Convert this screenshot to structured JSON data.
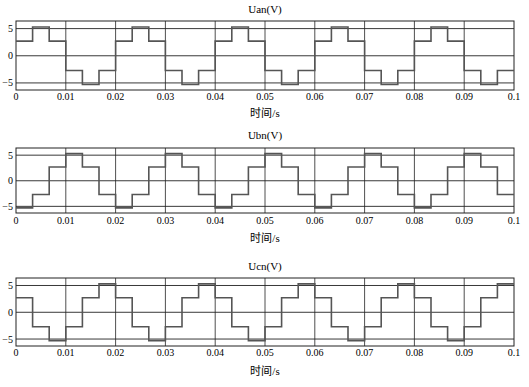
{
  "chart_data": [
    {
      "type": "line",
      "title": "Uan(V)",
      "xlabel": "时间/s",
      "ylabel": "",
      "xlim": [
        0,
        0.1
      ],
      "ylim": [
        -6.3,
        6.4
      ],
      "xticks": [
        "0",
        "0.01",
        "0.02",
        "0.03",
        "0.04",
        "0.05",
        "0.06",
        "0.07",
        "0.08",
        "0.09",
        "0.1"
      ],
      "yticks": [
        "5",
        "0",
        "-5"
      ],
      "grid": true,
      "step_period_s": 0.02,
      "pattern": [
        2.7,
        5.3,
        2.7,
        -2.7,
        -5.3,
        -2.7
      ]
    },
    {
      "type": "line",
      "title": "Ubn(V)",
      "xlabel": "时间/s",
      "ylabel": "",
      "xlim": [
        0,
        0.1
      ],
      "ylim": [
        -6.3,
        6.4
      ],
      "xticks": [
        "0",
        "0.01",
        "0.02",
        "0.03",
        "0.04",
        "0.05",
        "0.06",
        "0.07",
        "0.08",
        "0.09",
        "0.1"
      ],
      "yticks": [
        "5",
        "0",
        "-5"
      ],
      "grid": true,
      "step_period_s": 0.02,
      "pattern": [
        -5.3,
        -2.7,
        2.7,
        5.3,
        2.7,
        -2.7
      ]
    },
    {
      "type": "line",
      "title": "Ucn(V)",
      "xlabel": "时间/s",
      "ylabel": "",
      "xlim": [
        0,
        0.1
      ],
      "ylim": [
        -6.3,
        6.4
      ],
      "xticks": [
        "0",
        "0.01",
        "0.02",
        "0.03",
        "0.04",
        "0.05",
        "0.06",
        "0.07",
        "0.08",
        "0.09",
        "0.1"
      ],
      "yticks": [
        "5",
        "0",
        "-5"
      ],
      "grid": true,
      "step_period_s": 0.02,
      "pattern": [
        2.7,
        -2.7,
        -5.3,
        -2.7,
        2.7,
        5.3
      ]
    }
  ],
  "colors": {
    "grid": "#222222",
    "wave": "#555555",
    "background": "#ffffff"
  }
}
